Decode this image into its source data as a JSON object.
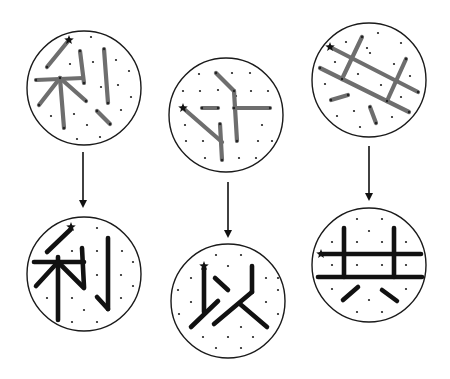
{
  "colors": {
    "background": "#ffffff",
    "circle_outline": "#1a1a1a",
    "dot": "#222222",
    "stroke_draft": "#6e6e6e",
    "stroke_corrected": "#111111",
    "star": "#111111",
    "arrow": "#111111"
  },
  "panels": [
    {
      "id": "draft-li",
      "character": "利",
      "stage": "draft",
      "center": [
        84,
        88
      ],
      "radius": 57,
      "star": [
        69,
        40
      ],
      "dots": [
        [
          91,
          37
        ],
        [
          70,
          64
        ],
        [
          93,
          62
        ],
        [
          116,
          60
        ],
        [
          129,
          71
        ],
        [
          101,
          87
        ],
        [
          118,
          85
        ],
        [
          131,
          97
        ],
        [
          121,
          110
        ],
        [
          51,
          116
        ],
        [
          74,
          114
        ],
        [
          87,
          125
        ],
        [
          77,
          139
        ],
        [
          100,
          137
        ]
      ],
      "strokes": [
        [
          [
            69,
            40
          ],
          [
            47,
            67
          ]
        ],
        [
          [
            36,
            80
          ],
          [
            83,
            78
          ]
        ],
        [
          [
            60,
            78
          ],
          [
            64,
            128
          ]
        ],
        [
          [
            60,
            78
          ],
          [
            39,
            105
          ]
        ],
        [
          [
            60,
            78
          ],
          [
            86,
            101
          ]
        ],
        [
          [
            80,
            51
          ],
          [
            84,
            83
          ]
        ],
        [
          [
            104,
            49
          ],
          [
            108,
            103
          ]
        ],
        [
          [
            97,
            111
          ],
          [
            110,
            124
          ]
        ]
      ]
    },
    {
      "id": "draft-yi",
      "character": "以",
      "stage": "draft",
      "center": [
        226,
        115
      ],
      "radius": 57,
      "star": [
        183,
        108
      ],
      "dots": [
        [
          199,
          74
        ],
        [
          232,
          73
        ],
        [
          250,
          73
        ],
        [
          183,
          91
        ],
        [
          200,
          91
        ],
        [
          218,
          90
        ],
        [
          251,
          91
        ],
        [
          268,
          91
        ],
        [
          236,
          96
        ],
        [
          185,
          125
        ],
        [
          203,
          125
        ],
        [
          262,
          125
        ],
        [
          268,
          108
        ],
        [
          186,
          141
        ],
        [
          203,
          141
        ],
        [
          258,
          141
        ],
        [
          272,
          141
        ],
        [
          205,
          158
        ],
        [
          239,
          158
        ],
        [
          256,
          158
        ]
      ],
      "strokes": [
        [
          [
            216,
            73
          ],
          [
            234,
            91
          ]
        ],
        [
          [
            234,
            91
          ],
          [
            237,
            141
          ]
        ],
        [
          [
            202,
            108
          ],
          [
            218,
            108
          ]
        ],
        [
          [
            234,
            108
          ],
          [
            270,
            108
          ]
        ],
        [
          [
            183,
            108
          ],
          [
            222,
            142
          ]
        ],
        [
          [
            220,
            124
          ],
          [
            222,
            160
          ]
        ]
      ]
    },
    {
      "id": "draft-gong",
      "character": "共",
      "stage": "draft",
      "center": [
        369,
        80
      ],
      "radius": 57,
      "star": [
        330,
        47
      ],
      "dots": [
        [
          378,
          33
        ],
        [
          346,
          42
        ],
        [
          367,
          48
        ],
        [
          401,
          43
        ],
        [
          370,
          53
        ],
        [
          335,
          62
        ],
        [
          394,
          64
        ],
        [
          410,
          76
        ],
        [
          325,
          84
        ],
        [
          358,
          74
        ],
        [
          381,
          85
        ],
        [
          401,
          97
        ],
        [
          354,
          111
        ],
        [
          337,
          116
        ],
        [
          392,
          117
        ],
        [
          360,
          127
        ]
      ],
      "strokes": [
        [
          [
            330,
            47
          ],
          [
            418,
            92
          ]
        ],
        [
          [
            320,
            68
          ],
          [
            409,
            112
          ]
        ],
        [
          [
            362,
            37
          ],
          [
            342,
            79
          ]
        ],
        [
          [
            406,
            59
          ],
          [
            387,
            101
          ]
        ],
        [
          [
            331,
            100
          ],
          [
            348,
            95
          ]
        ],
        [
          [
            370,
            107
          ],
          [
            376,
            123
          ]
        ]
      ]
    },
    {
      "id": "corrected-li",
      "character": "利",
      "stage": "corrected",
      "center": [
        84,
        274
      ],
      "radius": 57,
      "star": [
        71,
        227
      ],
      "dots": [
        [
          97,
          228
        ],
        [
          72,
          251
        ],
        [
          97,
          251
        ],
        [
          122,
          251
        ],
        [
          133,
          262
        ],
        [
          97,
          275
        ],
        [
          121,
          275
        ],
        [
          133,
          286
        ],
        [
          47,
          298
        ],
        [
          72,
          298
        ],
        [
          121,
          298
        ],
        [
          84,
          310
        ],
        [
          72,
          322
        ],
        [
          97,
          322
        ]
      ],
      "strokes": [
        [
          [
            71,
            229
          ],
          [
            47,
            252
          ]
        ],
        [
          [
            34,
            262
          ],
          [
            84,
            262
          ]
        ],
        [
          [
            58,
            257
          ],
          [
            58,
            320
          ]
        ],
        [
          [
            58,
            262
          ],
          [
            36,
            286
          ]
        ],
        [
          [
            58,
            262
          ],
          [
            84,
            288
          ]
        ],
        [
          [
            82,
            248
          ],
          [
            84,
            287
          ]
        ],
        [
          [
            108,
            238
          ],
          [
            108,
            309
          ]
        ],
        [
          [
            97,
            297
          ],
          [
            108,
            309
          ]
        ]
      ]
    },
    {
      "id": "corrected-yi",
      "character": "以",
      "stage": "corrected",
      "center": [
        228,
        301
      ],
      "radius": 57,
      "star": [
        204,
        266
      ],
      "dots": [
        [
          216,
          255
        ],
        [
          241,
          255
        ],
        [
          228,
          266
        ],
        [
          191,
          278
        ],
        [
          266,
          278
        ],
        [
          278,
          278
        ],
        [
          178,
          290
        ],
        [
          278,
          290
        ],
        [
          191,
          302
        ],
        [
          266,
          302
        ],
        [
          179,
          314
        ],
        [
          278,
          314
        ],
        [
          241,
          327
        ],
        [
          203,
          337
        ],
        [
          228,
          337
        ],
        [
          253,
          337
        ],
        [
          216,
          348
        ],
        [
          241,
          348
        ]
      ],
      "strokes": [
        [
          [
            204,
            268
          ],
          [
            204,
            312
          ]
        ],
        [
          [
            215,
            278
          ],
          [
            228,
            290
          ]
        ],
        [
          [
            191,
            327
          ],
          [
            218,
            301
          ]
        ],
        [
          [
            252,
            266
          ],
          [
            252,
            292
          ]
        ],
        [
          [
            252,
            292
          ],
          [
            214,
            324
          ]
        ],
        [
          [
            240,
            304
          ],
          [
            267,
            327
          ]
        ]
      ]
    },
    {
      "id": "corrected-gong",
      "character": "共",
      "stage": "corrected",
      "center": [
        369,
        265
      ],
      "radius": 57,
      "star": [
        321,
        254
      ],
      "dots": [
        [
          357,
          219
        ],
        [
          382,
          219
        ],
        [
          369,
          231
        ],
        [
          332,
          242
        ],
        [
          357,
          242
        ],
        [
          382,
          242
        ],
        [
          406,
          242
        ],
        [
          332,
          265
        ],
        [
          357,
          265
        ],
        [
          382,
          265
        ],
        [
          406,
          265
        ],
        [
          332,
          289
        ],
        [
          406,
          289
        ],
        [
          369,
          300
        ],
        [
          357,
          312
        ],
        [
          382,
          312
        ]
      ],
      "strokes": [
        [
          [
            321,
            254
          ],
          [
            421,
            254
          ]
        ],
        [
          [
            318,
            277
          ],
          [
            422,
            277
          ]
        ],
        [
          [
            344,
            228
          ],
          [
            344,
            277
          ]
        ],
        [
          [
            394,
            228
          ],
          [
            394,
            277
          ]
        ],
        [
          [
            343,
            300
          ],
          [
            358,
            287
          ]
        ],
        [
          [
            382,
            290
          ],
          [
            397,
            301
          ]
        ]
      ]
    }
  ],
  "arrows": [
    {
      "id": "arrow-li",
      "x": 83,
      "y1": 152,
      "y2": 208
    },
    {
      "id": "arrow-yi",
      "x": 228,
      "y1": 182,
      "y2": 238
    },
    {
      "id": "arrow-gong",
      "x": 369,
      "y1": 146,
      "y2": 201
    }
  ]
}
